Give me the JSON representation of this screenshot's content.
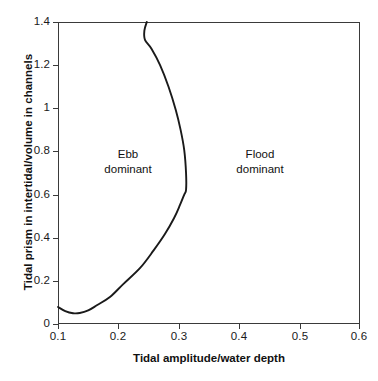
{
  "chart_data": {
    "type": "line",
    "title": "",
    "subtitle": "",
    "xlabel": "Tidal amplitude/water depth",
    "ylabel": "Tidal prism in intertidal/volume in channels",
    "xlim": [
      0.1,
      0.6
    ],
    "ylim": [
      0.0,
      1.4
    ],
    "grid": false,
    "legend": null,
    "x_ticks": [
      "0.1",
      "0.2",
      "0.3",
      "0.4",
      "0.5",
      "0.6"
    ],
    "x_tick_values": [
      0.1,
      0.2,
      0.3,
      0.4,
      0.5,
      0.6
    ],
    "y_ticks": [
      "0",
      "0.2",
      "0.4",
      "0.6",
      "0.8",
      "1",
      "1.2",
      "1.4"
    ],
    "y_tick_values": [
      0,
      0.2,
      0.4,
      0.6,
      0.8,
      1.0,
      1.2,
      1.4
    ],
    "series": [
      {
        "name": "Ebb/flood dominance boundary",
        "x": [
          0.1,
          0.112,
          0.125,
          0.136,
          0.15,
          0.165,
          0.186,
          0.208,
          0.236,
          0.258,
          0.277,
          0.292,
          0.302,
          0.309,
          0.312,
          0.312,
          0.309,
          0.303,
          0.295,
          0.283,
          0.269,
          0.255,
          0.244,
          0.243,
          0.247
        ],
        "y": [
          0.079,
          0.06,
          0.05,
          0.051,
          0.063,
          0.088,
          0.125,
          0.185,
          0.26,
          0.34,
          0.417,
          0.49,
          0.552,
          0.6,
          0.622,
          0.7,
          0.806,
          0.9,
          0.992,
          1.1,
          1.2,
          1.275,
          1.317,
          1.36,
          1.4
        ]
      }
    ],
    "annotations": [
      {
        "id": "ebb",
        "line1": "Ebb",
        "line2": "dominant",
        "x": 0.215,
        "y": 0.815
      },
      {
        "id": "flood",
        "line1": "Flood",
        "line2": "dominant",
        "x": 0.428,
        "y": 0.815
      }
    ],
    "colors": {
      "curve": "#1a1a1a",
      "axis": "#3a3a3a",
      "text": "#111111",
      "background": "#ffffff"
    }
  }
}
